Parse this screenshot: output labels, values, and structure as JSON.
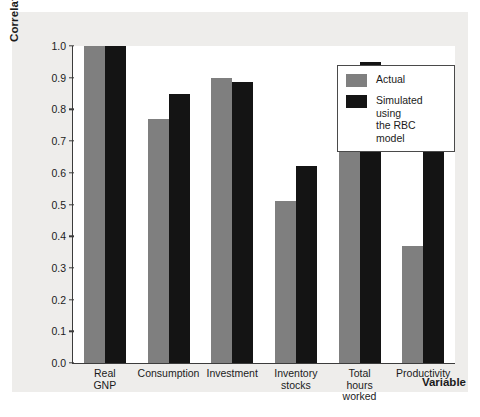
{
  "chart_data": {
    "type": "bar",
    "title": "",
    "xlabel": "Variable",
    "ylabel": "Correlation",
    "ylim": [
      0.0,
      1.0
    ],
    "ytick_labels": [
      "1.0",
      "0.9",
      "0.8",
      "0.7",
      "0.6",
      "0.5",
      "0.4",
      "0.3",
      "0.2",
      "0.1",
      "0.0"
    ],
    "ytick_values": [
      1.0,
      0.9,
      0.8,
      0.7,
      0.6,
      0.5,
      0.4,
      0.3,
      0.2,
      0.1,
      0.0
    ],
    "grid": false,
    "legend_position": "top-right",
    "categories": [
      "Real GNP",
      "Consumption",
      "Investment",
      "Inventory\nstocks",
      "Total hours\nworked",
      "Productivity"
    ],
    "series": [
      {
        "name": "Actual",
        "color": "#7f7f7f",
        "values": [
          1.0,
          0.77,
          0.9,
          0.51,
          0.86,
          0.37
        ]
      },
      {
        "name": "Simulated using\nthe RBC model",
        "color": "#141414",
        "values": [
          1.0,
          0.85,
          0.885,
          0.62,
          0.95,
          0.87
        ]
      }
    ]
  },
  "legend": {
    "items": [
      {
        "label": "Actual",
        "swatch": "actual"
      },
      {
        "label": "Simulated using\nthe RBC model",
        "swatch": "sim"
      }
    ]
  }
}
